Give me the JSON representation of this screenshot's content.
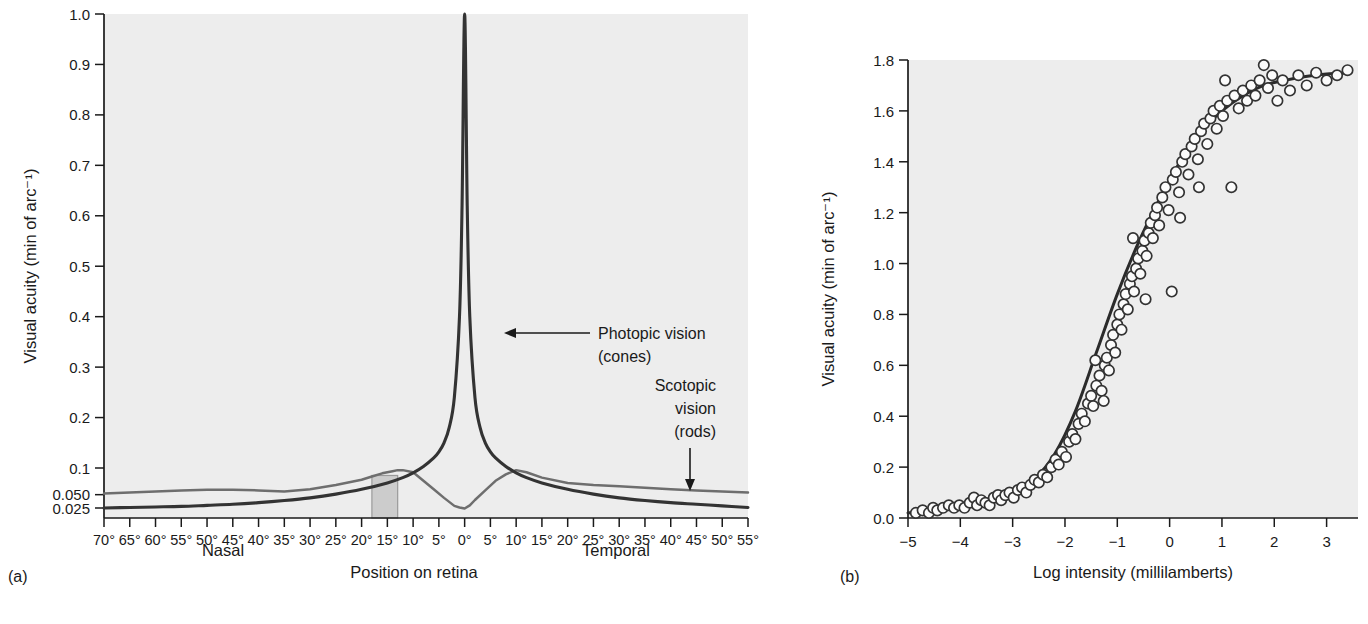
{
  "figure": {
    "panel_a_label": "(a)",
    "panel_b_label": "(b)"
  },
  "panel_a": {
    "ylabel": "Visual acuity (min of arc⁻¹)",
    "xlabel": "Position on retina",
    "xlabel_left": "Nasal",
    "xlabel_right": "Temporal",
    "annotation_photopic_line1": "Photopic vision",
    "annotation_photopic_line2": "(cones)",
    "annotation_scotopic_line1": "Scotopic",
    "annotation_scotopic_line2": "vision",
    "annotation_scotopic_line3": "(rods)",
    "yticks": [
      "1.0",
      "0.9",
      "0.8",
      "0.7",
      "0.6",
      "0.5",
      "0.4",
      "0.3",
      "0.2",
      "0.1",
      "0.050",
      "0.025"
    ],
    "xticks": [
      "70°",
      "65°",
      "60°",
      "55°",
      "50°",
      "45°",
      "40°",
      "35°",
      "30°",
      "25°",
      "20°",
      "15°",
      "10°",
      "5°",
      "0°",
      "5°",
      "10°",
      "15°",
      "20°",
      "25°",
      "30°",
      "35°",
      "40°",
      "45°",
      "50°",
      "55°"
    ]
  },
  "panel_b": {
    "ylabel": "Visual acuity (min of arc⁻¹)",
    "xlabel": "Log intensity  (millilamberts)",
    "yticks": [
      "1.8",
      "1.6",
      "1.4",
      "1.2",
      "1.0",
      "0.8",
      "0.6",
      "0.4",
      "0.2",
      "0.0"
    ],
    "xticks": [
      "−5",
      "−4",
      "−3",
      "−2",
      "−1",
      "0",
      "1",
      "2",
      "3"
    ]
  },
  "colors": {
    "plot_background": "#ededed",
    "photopic_curve": "#333333",
    "scotopic_curve": "#6e6e6e",
    "blind_spot_fill": "#cccccc",
    "fit_curve": "#2b2b2b",
    "data_point_stroke": "#333333",
    "axis": "#1a1a1a"
  },
  "chart_data": [
    {
      "type": "line",
      "panel": "(a)",
      "title": "",
      "xlabel": "Position on retina",
      "ylabel": "Visual acuity (min of arc⁻¹)",
      "xlim": [
        -70,
        55
      ],
      "ylim": [
        0.025,
        1.0
      ],
      "y_scale": "custom-compressed-below-0.1",
      "grid": false,
      "legend": "annotations",
      "x_tick_values": [
        -70,
        -65,
        -60,
        -55,
        -50,
        -45,
        -40,
        -35,
        -30,
        -25,
        -20,
        -15,
        -10,
        -5,
        0,
        5,
        10,
        15,
        20,
        25,
        30,
        35,
        40,
        45,
        50,
        55
      ],
      "x_tick_labels": [
        "70°",
        "65°",
        "60°",
        "55°",
        "50°",
        "45°",
        "40°",
        "35°",
        "30°",
        "25°",
        "20°",
        "15°",
        "10°",
        "5°",
        "0°",
        "5°",
        "10°",
        "15°",
        "20°",
        "25°",
        "30°",
        "35°",
        "40°",
        "45°",
        "50°",
        "55°"
      ],
      "y_tick_values": [
        1.0,
        0.9,
        0.8,
        0.7,
        0.6,
        0.5,
        0.4,
        0.3,
        0.2,
        0.1,
        0.05,
        0.025
      ],
      "annotations": [
        {
          "text": "Photopic vision (cones)",
          "arrow": "left",
          "points_to_x": -3,
          "points_to_y": 0.42
        },
        {
          "text": "Scotopic vision (rods)",
          "arrow": "down",
          "points_to_x": 39,
          "points_to_y": 0.055
        },
        {
          "text": "Blind spot (shaded band)",
          "x_range": [
            -18,
            -13
          ]
        }
      ],
      "series": [
        {
          "name": "Photopic vision (cones)",
          "color": "#333333",
          "x": [
            -70,
            -65,
            -60,
            -55,
            -50,
            -45,
            -40,
            -35,
            -30,
            -25,
            -20,
            -15,
            -12,
            -10,
            -8,
            -6,
            -5,
            -4,
            -3,
            -2,
            -1,
            -0.5,
            0,
            0.5,
            1,
            2,
            3,
            4,
            5,
            6,
            8,
            10,
            12,
            15,
            20,
            25,
            30,
            35,
            40,
            45,
            50,
            55
          ],
          "y": [
            0.025,
            0.026,
            0.027,
            0.028,
            0.03,
            0.032,
            0.035,
            0.039,
            0.044,
            0.051,
            0.06,
            0.072,
            0.082,
            0.091,
            0.103,
            0.12,
            0.132,
            0.15,
            0.18,
            0.24,
            0.4,
            0.62,
            1.0,
            0.62,
            0.4,
            0.24,
            0.18,
            0.15,
            0.132,
            0.12,
            0.103,
            0.091,
            0.082,
            0.072,
            0.06,
            0.051,
            0.044,
            0.039,
            0.035,
            0.032,
            0.029,
            0.026
          ]
        },
        {
          "name": "Scotopic vision (rods)",
          "color": "#6e6e6e",
          "x": [
            -70,
            -65,
            -60,
            -55,
            -50,
            -45,
            -40,
            -35,
            -30,
            -25,
            -20,
            -18,
            -16,
            -14,
            -13,
            -12,
            -10,
            -8,
            -6,
            -4,
            -2,
            -1,
            0,
            1,
            2,
            4,
            6,
            8,
            10,
            12,
            15,
            20,
            25,
            30,
            35,
            40,
            45,
            50,
            55
          ],
          "y": [
            0.052,
            0.054,
            0.056,
            0.058,
            0.059,
            0.059,
            0.058,
            0.056,
            0.06,
            0.068,
            0.078,
            0.084,
            0.09,
            0.094,
            0.096,
            0.096,
            0.092,
            0.076,
            0.06,
            0.044,
            0.029,
            0.026,
            0.024,
            0.03,
            0.04,
            0.058,
            0.076,
            0.088,
            0.096,
            0.092,
            0.082,
            0.072,
            0.068,
            0.066,
            0.063,
            0.06,
            0.058,
            0.056,
            0.054
          ]
        }
      ]
    },
    {
      "type": "scatter",
      "panel": "(b)",
      "title": "",
      "xlabel": "Log intensity  (millilamberts)",
      "ylabel": "Visual acuity (min of arc⁻¹)",
      "xlim": [
        -5.0,
        3.6
      ],
      "ylim": [
        0.0,
        1.8
      ],
      "grid": false,
      "legend": "none",
      "x_tick_values": [
        -5,
        -4,
        -3,
        -2,
        -1,
        0,
        1,
        2,
        3
      ],
      "y_tick_values": [
        1.8,
        1.6,
        1.4,
        1.2,
        1.0,
        0.8,
        0.6,
        0.4,
        0.2,
        0.0
      ],
      "fit_curve": {
        "name": "sigmoid fit",
        "x": [
          -5.0,
          -4.6,
          -4.2,
          -3.8,
          -3.4,
          -3.0,
          -2.6,
          -2.2,
          -1.8,
          -1.4,
          -1.0,
          -0.6,
          -0.2,
          0.2,
          0.6,
          1.0,
          1.4,
          1.8,
          2.2,
          2.6,
          3.0,
          3.45
        ],
        "y": [
          0.02,
          0.03,
          0.04,
          0.05,
          0.07,
          0.1,
          0.15,
          0.25,
          0.42,
          0.65,
          0.88,
          1.08,
          1.25,
          1.4,
          1.52,
          1.6,
          1.66,
          1.7,
          1.72,
          1.735,
          1.745,
          1.75
        ]
      },
      "points": [
        [
          -4.85,
          0.02
        ],
        [
          -4.72,
          0.03
        ],
        [
          -4.6,
          0.02
        ],
        [
          -4.52,
          0.04
        ],
        [
          -4.44,
          0.03
        ],
        [
          -4.33,
          0.04
        ],
        [
          -4.22,
          0.05
        ],
        [
          -4.12,
          0.04
        ],
        [
          -4.02,
          0.05
        ],
        [
          -3.92,
          0.04
        ],
        [
          -3.82,
          0.06
        ],
        [
          -3.74,
          0.08
        ],
        [
          -3.68,
          0.05
        ],
        [
          -3.6,
          0.07
        ],
        [
          -3.52,
          0.06
        ],
        [
          -3.44,
          0.05
        ],
        [
          -3.36,
          0.08
        ],
        [
          -3.28,
          0.09
        ],
        [
          -3.22,
          0.07
        ],
        [
          -3.14,
          0.09
        ],
        [
          -3.06,
          0.1
        ],
        [
          -2.98,
          0.08
        ],
        [
          -2.9,
          0.11
        ],
        [
          -2.82,
          0.12
        ],
        [
          -2.74,
          0.1
        ],
        [
          -2.66,
          0.13
        ],
        [
          -2.58,
          0.15
        ],
        [
          -2.5,
          0.14
        ],
        [
          -2.42,
          0.17
        ],
        [
          -2.34,
          0.16
        ],
        [
          -2.26,
          0.2
        ],
        [
          -2.18,
          0.23
        ],
        [
          -2.12,
          0.21
        ],
        [
          -2.06,
          0.26
        ],
        [
          -1.98,
          0.24
        ],
        [
          -1.92,
          0.3
        ],
        [
          -1.86,
          0.33
        ],
        [
          -1.8,
          0.31
        ],
        [
          -1.74,
          0.37
        ],
        [
          -1.68,
          0.41
        ],
        [
          -1.62,
          0.38
        ],
        [
          -1.56,
          0.45
        ],
        [
          -1.5,
          0.48
        ],
        [
          -1.46,
          0.44
        ],
        [
          -1.4,
          0.52
        ],
        [
          -1.34,
          0.56
        ],
        [
          -1.3,
          0.5
        ],
        [
          -1.24,
          0.6
        ],
        [
          -1.2,
          0.63
        ],
        [
          -1.16,
          0.58
        ],
        [
          -1.12,
          0.68
        ],
        [
          -1.08,
          0.72
        ],
        [
          -1.04,
          0.65
        ],
        [
          -1.0,
          0.76
        ],
        [
          -0.96,
          0.8
        ],
        [
          -0.92,
          0.74
        ],
        [
          -0.88,
          0.84
        ],
        [
          -0.84,
          0.88
        ],
        [
          -0.8,
          0.82
        ],
        [
          -0.76,
          0.92
        ],
        [
          -0.72,
          0.95
        ],
        [
          -0.68,
          0.89
        ],
        [
          -0.64,
          0.98
        ],
        [
          -0.6,
          1.02
        ],
        [
          -0.56,
          0.96
        ],
        [
          -0.52,
          1.05
        ],
        [
          -0.48,
          1.09
        ],
        [
          -0.44,
          1.03
        ],
        [
          -0.4,
          1.12
        ],
        [
          -0.36,
          1.16
        ],
        [
          -0.32,
          1.1
        ],
        [
          -0.28,
          1.19
        ],
        [
          -0.24,
          1.22
        ],
        [
          -0.2,
          1.15
        ],
        [
          -0.14,
          1.26
        ],
        [
          -0.08,
          1.3
        ],
        [
          -0.02,
          1.21
        ],
        [
          0.04,
          0.89
        ],
        [
          0.06,
          1.33
        ],
        [
          0.12,
          1.36
        ],
        [
          0.18,
          1.28
        ],
        [
          0.24,
          1.4
        ],
        [
          0.3,
          1.43
        ],
        [
          0.36,
          1.35
        ],
        [
          0.42,
          1.46
        ],
        [
          0.48,
          1.49
        ],
        [
          0.54,
          1.41
        ],
        [
          0.6,
          1.52
        ],
        [
          0.66,
          1.55
        ],
        [
          0.72,
          1.47
        ],
        [
          0.78,
          1.57
        ],
        [
          0.84,
          1.6
        ],
        [
          0.9,
          1.53
        ],
        [
          0.96,
          1.62
        ],
        [
          1.02,
          1.58
        ],
        [
          1.1,
          1.64
        ],
        [
          1.18,
          1.3
        ],
        [
          1.24,
          1.66
        ],
        [
          1.32,
          1.61
        ],
        [
          1.4,
          1.68
        ],
        [
          1.48,
          1.64
        ],
        [
          1.56,
          1.7
        ],
        [
          1.64,
          1.66
        ],
        [
          1.72,
          1.72
        ],
        [
          1.8,
          1.78
        ],
        [
          1.88,
          1.69
        ],
        [
          1.96,
          1.74
        ],
        [
          2.06,
          1.64
        ],
        [
          2.16,
          1.72
        ],
        [
          2.3,
          1.68
        ],
        [
          2.46,
          1.74
        ],
        [
          2.62,
          1.7
        ],
        [
          2.8,
          1.75
        ],
        [
          3.0,
          1.72
        ],
        [
          3.2,
          1.74
        ],
        [
          3.4,
          1.76
        ],
        [
          -1.42,
          0.62
        ],
        [
          -1.26,
          0.46
        ],
        [
          -0.7,
          1.1
        ],
        [
          -0.46,
          0.86
        ],
        [
          0.2,
          1.18
        ],
        [
          0.56,
          1.3
        ],
        [
          1.06,
          1.72
        ]
      ]
    }
  ]
}
